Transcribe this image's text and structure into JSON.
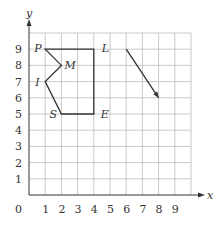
{
  "figure": {
    "axes": {
      "x_label": "x",
      "y_label": "y",
      "origin_label": "0",
      "x_ticks": [
        "1",
        "2",
        "3",
        "4",
        "5",
        "6",
        "7",
        "8",
        "9"
      ],
      "y_ticks": [
        "1",
        "2",
        "3",
        "4",
        "5",
        "6",
        "7",
        "8",
        "9"
      ],
      "grid": true,
      "range": [
        0,
        10
      ]
    },
    "shape": {
      "vertices": [
        {
          "label": "P",
          "x": 1,
          "y": 9
        },
        {
          "label": "L",
          "x": 4,
          "y": 9
        },
        {
          "label": "E",
          "x": 4,
          "y": 5
        },
        {
          "label": "S",
          "x": 2,
          "y": 5
        },
        {
          "label": "I",
          "x": 1,
          "y": 7
        },
        {
          "label": "M",
          "x": 2,
          "y": 8
        }
      ]
    },
    "vector": {
      "from": [
        6,
        9
      ],
      "to": [
        8,
        6
      ]
    },
    "colors": {
      "grid": "#bbbbbb",
      "axis": "#333333",
      "shape": "#333333"
    }
  }
}
